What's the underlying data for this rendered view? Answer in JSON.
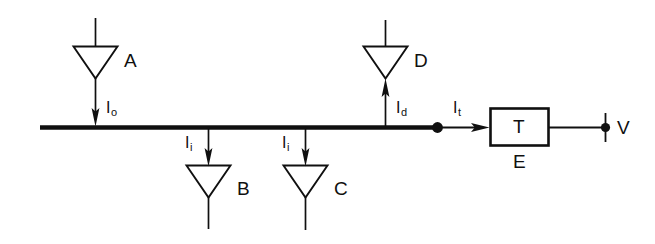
{
  "diagram": {
    "type": "schematic",
    "background_color": "#ffffff",
    "line_color": "#101010",
    "devices": [
      {
        "id": "A",
        "label": "A",
        "shape": "triangle-down",
        "direction": "into-bus",
        "current_label": "I",
        "current_subscript": "o"
      },
      {
        "id": "B",
        "label": "B",
        "shape": "triangle-down",
        "direction": "out-of-bus",
        "current_label": "I",
        "current_subscript": "i"
      },
      {
        "id": "C",
        "label": "C",
        "shape": "triangle-down",
        "direction": "out-of-bus",
        "current_label": "I",
        "current_subscript": "i"
      },
      {
        "id": "D",
        "label": "D",
        "shape": "triangle-down",
        "direction": "out-of-bus-upward",
        "current_label": "I",
        "current_subscript": "d"
      }
    ],
    "block": {
      "label": "T",
      "sublabel": "E"
    },
    "terminal": {
      "label": "V"
    },
    "currents": {
      "io": {
        "symbol": "I",
        "sub": "o"
      },
      "ii_b": {
        "symbol": "I",
        "sub": "i"
      },
      "ii_c": {
        "symbol": "I",
        "sub": "i"
      },
      "id": {
        "symbol": "I",
        "sub": "d"
      },
      "it": {
        "symbol": "I",
        "sub": "t"
      }
    },
    "labels": {
      "device_a": "A",
      "device_b": "B",
      "device_c": "C",
      "device_d": "D",
      "block_t": "T",
      "block_e": "E",
      "terminal_v": "V"
    }
  }
}
